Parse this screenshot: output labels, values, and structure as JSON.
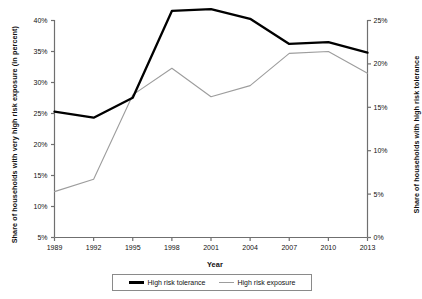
{
  "chart_data": {
    "type": "line",
    "title": "",
    "xlabel": "Year",
    "categories": [
      1989,
      1992,
      1995,
      1998,
      2001,
      2004,
      2007,
      2010,
      2013
    ],
    "xtick_labels": [
      "1989",
      "1992",
      "1995",
      "1998",
      "2001",
      "2004",
      "2007",
      "2010",
      "2013"
    ],
    "xlim": [
      1989,
      2013
    ],
    "grid": false,
    "legend_position": "bottom-center",
    "axes": {
      "left": {
        "label": "Share of households with very high risk exposure (in percent)",
        "ylim": [
          5,
          40
        ],
        "ticks": [
          5,
          10,
          15,
          20,
          25,
          30,
          35,
          40
        ],
        "tick_labels": [
          "5%",
          "10%",
          "15%",
          "20%",
          "25%",
          "30%",
          "35%",
          "40%"
        ],
        "series": "High risk exposure"
      },
      "right": {
        "label": "Share of households with high risk tolerance",
        "ylim": [
          0,
          25
        ],
        "ticks": [
          0,
          5,
          10,
          15,
          20,
          25
        ],
        "tick_labels": [
          "0%",
          "5%",
          "10%",
          "15%",
          "20%",
          "25%"
        ],
        "series": "High risk tolerance"
      }
    },
    "series": [
      {
        "name": "High risk tolerance",
        "axis": "right",
        "color": "#000000",
        "line_width": 2.3,
        "values": [
          14.5,
          13.8,
          16.1,
          26.1,
          26.3,
          25.2,
          22.3,
          22.5,
          21.3
        ]
      },
      {
        "name": "High risk exposure",
        "axis": "left",
        "color": "#9d9d9d",
        "line_width": 1.1,
        "values": [
          12.4,
          14.4,
          28.0,
          32.3,
          27.7,
          29.5,
          34.7,
          35.0,
          31.5
        ]
      }
    ]
  },
  "legend": {
    "items": [
      {
        "label": "High risk tolerance",
        "swatch": "black-thick-line"
      },
      {
        "label": "High risk exposure",
        "swatch": "gray-thin-line"
      }
    ]
  }
}
